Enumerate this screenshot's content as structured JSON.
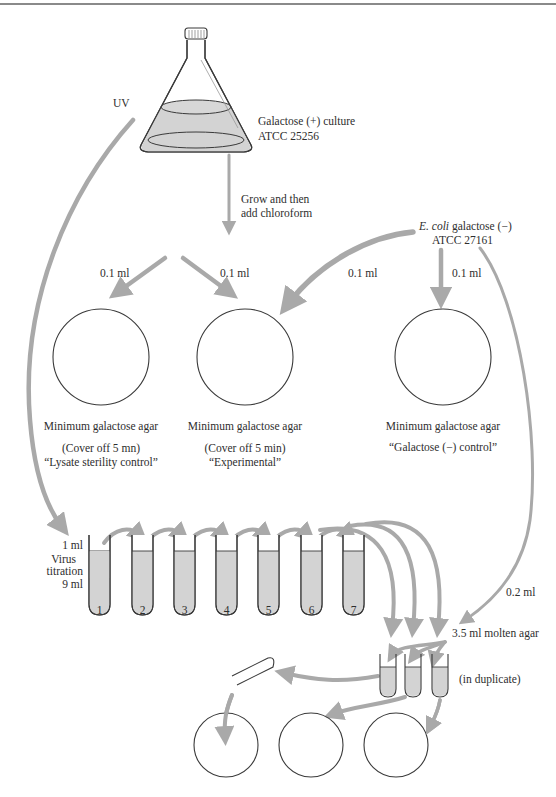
{
  "colors": {
    "arrow": "#a9a9a9",
    "liquid": "#d3d3d3",
    "outline": "#3a3a3a",
    "text": "#2e2e2e"
  },
  "flask": {
    "label_line1": "Galactose (+) culture",
    "label_line2": "ATCC 25256",
    "uv_label": "UV"
  },
  "step1": {
    "line1": "Grow and then",
    "line2": "add chloroform"
  },
  "ecoli": {
    "species": "E. coli",
    "line1_rest": " galactose (−)",
    "line2": "ATCC 27161"
  },
  "volumes": {
    "plate1": "0.1 ml",
    "plate2_from_lysate": "0.1 ml",
    "plate2_from_ecoli": "0.1 ml",
    "plate3": "0.1 ml",
    "to_agar": "0.2 ml"
  },
  "plates": [
    {
      "medium": "Minimum galactose agar",
      "note": "(Cover off 5 mn)",
      "name": "“Lysate sterility control”"
    },
    {
      "medium": "Minimum galactose agar",
      "note": "(Cover off 5 min)",
      "name": "“Experimental”"
    },
    {
      "medium": "Minimum galactose agar",
      "note": "",
      "name": "“Galactose (−) control”"
    }
  ],
  "titration": {
    "top_label": "1 ml",
    "mid_label_1": "Virus",
    "mid_label_2": "titration",
    "bottom_label": "9 ml",
    "tube_numbers": [
      "1",
      "2",
      "3",
      "4",
      "5",
      "6",
      "7"
    ]
  },
  "agar": {
    "label": "3.5 ml molten agar",
    "duplicate_note": "(in duplicate)"
  }
}
